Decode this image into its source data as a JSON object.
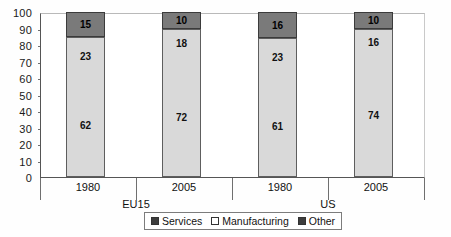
{
  "chart_data": {
    "type": "bar",
    "stacked": true,
    "title": "",
    "xlabel": "",
    "ylabel": "",
    "ylim": [
      0,
      100
    ],
    "yticks": [
      0,
      10,
      20,
      30,
      40,
      50,
      60,
      70,
      80,
      90,
      100
    ],
    "grid": false,
    "legend_position": "bottom-center",
    "categories": [
      "1980",
      "2005",
      "1980",
      "2005"
    ],
    "groups": [
      "EU15",
      "US"
    ],
    "group_spans": [
      2,
      2
    ],
    "series": [
      {
        "name": "Services",
        "values": [
          62,
          72,
          61,
          74
        ],
        "color": "#d9d9d9"
      },
      {
        "name": "Manufacturing",
        "values": [
          23,
          18,
          23,
          16
        ],
        "color": "#d9d9d9"
      },
      {
        "name": "Other",
        "values": [
          15,
          10,
          16,
          10
        ],
        "color": "#7a7a7a"
      }
    ]
  },
  "axis": {
    "y_labels": [
      "100",
      "90",
      "80",
      "70",
      "60",
      "50",
      "40",
      "30",
      "20",
      "10",
      "0"
    ],
    "x_years": [
      "1980",
      "2005",
      "1980",
      "2005"
    ],
    "x_groups": [
      "EU15",
      "US"
    ]
  },
  "bars": [
    {
      "year": "1980",
      "group": "EU15",
      "services": "62",
      "manufacturing": "23",
      "other": "15"
    },
    {
      "year": "2005",
      "group": "EU15",
      "services": "72",
      "manufacturing": "18",
      "other": "10"
    },
    {
      "year": "1980",
      "group": "US",
      "services": "61",
      "manufacturing": "23",
      "other": "16"
    },
    {
      "year": "2005",
      "group": "US",
      "services": "74",
      "manufacturing": "16",
      "other": "10"
    }
  ],
  "legend": {
    "items": [
      {
        "label": "Services",
        "marker": "filled-square",
        "color": "#3d3d3d"
      },
      {
        "label": "Manufacturing",
        "marker": "hollow-square",
        "color": "#ffffff"
      },
      {
        "label": "Other",
        "marker": "filled-square",
        "color": "#3d3d3d"
      }
    ]
  },
  "caption": ""
}
